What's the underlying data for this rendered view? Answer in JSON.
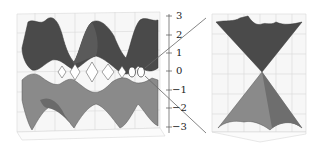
{
  "figure": {
    "left_panel": {
      "description": "3D band structure surface plot with two bands touching at several points",
      "z_axis": {
        "ticks": [
          "3",
          "2",
          "1",
          "0",
          "−1",
          "−2",
          "−3"
        ],
        "range": [
          -3,
          3
        ]
      },
      "highlight": "circled band-touching point (right side)"
    },
    "right_panel": {
      "description": "zoomed-in Dirac cone at the highlighted band-touching point"
    },
    "colors": {
      "upper_band": "#4a4a4a",
      "lower_band": "#8a8a8a",
      "grid": "#d8d8d8",
      "axis": "#555555"
    }
  }
}
